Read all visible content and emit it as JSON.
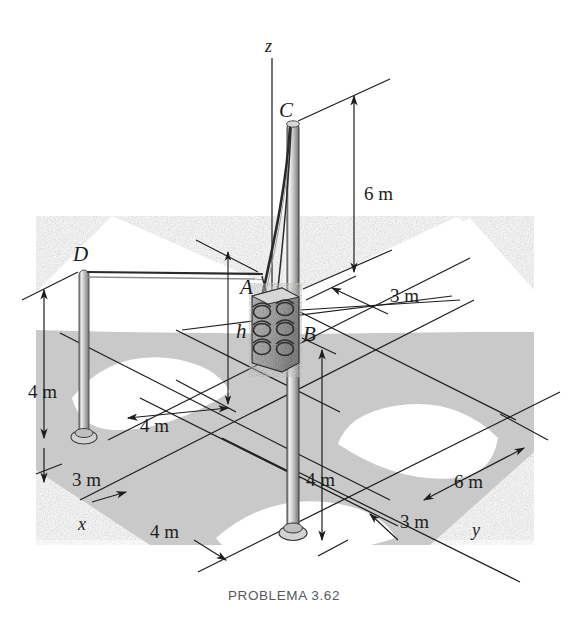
{
  "caption": "PROBLEMA 3.62",
  "figure": {
    "type": "engineering-statics-diagram",
    "background_color": "#ffffff",
    "ground_color": "#c9c9c9",
    "road_color": "#ffffff",
    "line_color": "#1d1d1d"
  },
  "axes": [
    {
      "name": "z-axis",
      "label": "z"
    },
    {
      "name": "x-axis",
      "label": "x"
    },
    {
      "name": "y-axis",
      "label": "y"
    }
  ],
  "points": [
    {
      "name": "point-a",
      "label": "A"
    },
    {
      "name": "point-b",
      "label": "B"
    },
    {
      "name": "point-c",
      "label": "C"
    },
    {
      "name": "point-d",
      "label": "D"
    }
  ],
  "unknowns": [
    {
      "name": "height-h",
      "label": "h"
    }
  ],
  "dimensions": [
    {
      "id": "dim-6m-top",
      "label": "6 m"
    },
    {
      "id": "dim-3m-upper",
      "label": "3 m"
    },
    {
      "id": "dim-4m-left",
      "label": "4 m"
    },
    {
      "id": "dim-4m-mid",
      "label": "4 m"
    },
    {
      "id": "dim-3m-lower-left",
      "label": "3 m"
    },
    {
      "id": "dim-4m-bottom-left",
      "label": "4 m"
    },
    {
      "id": "dim-4m-right",
      "label": "4 m"
    },
    {
      "id": "dim-3m-bottom-right",
      "label": "3 m"
    },
    {
      "id": "dim-6m-right",
      "label": "6 m"
    }
  ],
  "members": [
    {
      "name": "mast-main",
      "from": "B",
      "to": "C"
    },
    {
      "name": "pole-d",
      "from": "ground",
      "to": "D"
    },
    {
      "name": "cable-c-a",
      "from": "C",
      "to": "A"
    },
    {
      "name": "cable-d-a",
      "from": "D",
      "to": "A"
    },
    {
      "name": "signal-head",
      "at": "A-B"
    }
  ]
}
